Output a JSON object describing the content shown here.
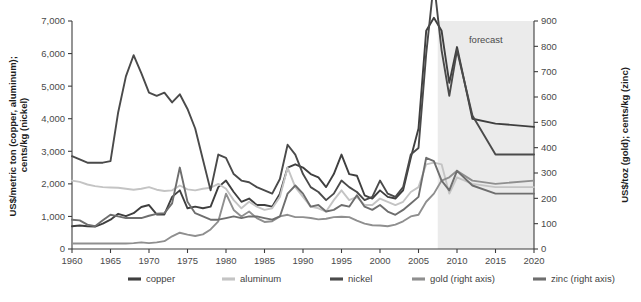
{
  "chart_data": {
    "type": "line",
    "title": "",
    "xlabel": "",
    "ylabel": "US$/metric ton (copper, aluminum); cents/kg (nickel)",
    "y2label": "US$/toz (gold); cents/kg (zinc)",
    "xlim": [
      1960,
      2020
    ],
    "ylim": [
      0,
      7000
    ],
    "y2lim": [
      0,
      900
    ],
    "grid": false,
    "legend_position": "bottom",
    "x_ticks": [
      1960,
      1965,
      1970,
      1975,
      1980,
      1985,
      1990,
      1995,
      2000,
      2005,
      2010,
      2015,
      2020
    ],
    "y_ticks": [
      0,
      1000,
      2000,
      3000,
      4000,
      5000,
      6000,
      7000
    ],
    "y_tick_labels": [
      "0",
      "1,000",
      "2,000",
      "3,000",
      "4,000",
      "5,000",
      "6,000",
      "7,000"
    ],
    "y2_ticks": [
      0,
      100,
      200,
      300,
      400,
      500,
      600,
      700,
      800,
      900
    ],
    "y2_tick_labels": [
      "0",
      "100",
      "200",
      "300",
      "400",
      "500",
      "600",
      "700",
      "800",
      "900"
    ],
    "annotations": [
      {
        "text": "forecast",
        "x_start": 2007.5,
        "x_end": 2020,
        "type": "shaded-band"
      }
    ],
    "x": [
      1960,
      1961,
      1962,
      1963,
      1964,
      1965,
      1966,
      1967,
      1968,
      1969,
      1970,
      1971,
      1972,
      1973,
      1974,
      1975,
      1976,
      1977,
      1978,
      1979,
      1980,
      1981,
      1982,
      1983,
      1984,
      1985,
      1986,
      1987,
      1988,
      1989,
      1990,
      1991,
      1992,
      1993,
      1994,
      1995,
      1996,
      1997,
      1998,
      1999,
      2000,
      2001,
      2002,
      2003,
      2004,
      2005,
      2006,
      2007,
      2008,
      2009,
      2010,
      2012,
      2015,
      2020
    ],
    "series": [
      {
        "name": "copper",
        "axis": "left",
        "unit": "US$/metric ton",
        "color": "#3f3f3f",
        "values": [
          700,
          720,
          700,
          690,
          780,
          900,
          1080,
          1010,
          1100,
          1290,
          1350,
          1060,
          1060,
          1600,
          1800,
          1250,
          1300,
          1250,
          1300,
          1900,
          2100,
          1750,
          1450,
          1550,
          1350,
          1350,
          1300,
          1700,
          2500,
          2600,
          2500,
          2300,
          2200,
          1900,
          2300,
          2900,
          2300,
          2250,
          1650,
          1550,
          1800,
          1600,
          1550,
          1800,
          2800,
          3700,
          6700,
          7100,
          6700,
          5100,
          6200,
          4000,
          3850,
          3750
        ],
        "label_at_end": 2900
      },
      {
        "name": "aluminum",
        "axis": "left",
        "unit": "US$/metric ton",
        "color": "#c4c4c4",
        "values": [
          2100,
          2060,
          1980,
          1930,
          1900,
          1890,
          1880,
          1850,
          1820,
          1850,
          1900,
          1820,
          1780,
          1800,
          1950,
          1830,
          1800,
          1850,
          1880,
          2000,
          1850,
          1500,
          1250,
          1450,
          1300,
          1200,
          1250,
          1600,
          2500,
          1900,
          1600,
          1300,
          1250,
          1150,
          1500,
          1800,
          1500,
          1600,
          1350,
          1350,
          1550,
          1450,
          1350,
          1450,
          1750,
          1900,
          2600,
          2650,
          2600,
          1700,
          2200,
          2000,
          1900,
          1900
        ]
      },
      {
        "name": "nickel",
        "axis": "left",
        "unit": "cents/kg",
        "color": "#4a4a4a",
        "values": [
          2850,
          2750,
          2650,
          2650,
          2650,
          2700,
          4200,
          5300,
          5950,
          5400,
          4800,
          4700,
          4800,
          4500,
          4750,
          4300,
          3700,
          2750,
          1800,
          2900,
          2800,
          2300,
          2100,
          2050,
          1900,
          1800,
          1700,
          2150,
          3200,
          2900,
          2300,
          1900,
          1750,
          1500,
          1700,
          2100,
          1900,
          1750,
          1500,
          1600,
          2100,
          1700,
          1600,
          1900,
          2900,
          3100,
          6000,
          8200,
          6100,
          4700,
          6100,
          4100,
          2900,
          2900
        ]
      },
      {
        "name": "gold",
        "axis": "right",
        "unit": "US$/toz",
        "color": "#8f8f8f",
        "values": [
          170,
          170,
          170,
          170,
          170,
          170,
          170,
          170,
          180,
          205,
          180,
          205,
          240,
          390,
          500,
          440,
          400,
          450,
          600,
          850,
          1700,
          1200,
          1000,
          1150,
          950,
          830,
          850,
          1000,
          1050,
          980,
          980,
          950,
          910,
          930,
          980,
          990,
          980,
          870,
          780,
          730,
          720,
          700,
          750,
          850,
          1000,
          1050,
          1450,
          1700,
          2100,
          2200,
          2400,
          2100,
          2000,
          2100
        ],
        "note": "plotted on right axis scale 0-900"
      },
      {
        "name": "zinc",
        "axis": "right",
        "unit": "cents/kg",
        "color": "#6e6e6e",
        "values": [
          900,
          880,
          750,
          700,
          880,
          1050,
          1000,
          950,
          950,
          950,
          1020,
          1080,
          1100,
          1400,
          2500,
          1450,
          1100,
          1000,
          900,
          900,
          950,
          1000,
          950,
          1000,
          1000,
          950,
          900,
          1000,
          1700,
          1950,
          1700,
          1300,
          1350,
          1150,
          1200,
          1350,
          1300,
          1650,
          1300,
          1200,
          1350,
          1150,
          1050,
          1200,
          1400,
          1600,
          2800,
          2700,
          2100,
          1800,
          2400,
          1950,
          1700,
          1700
        ],
        "note": "plotted on right axis scale 0-900"
      }
    ]
  },
  "axes": {
    "left_title": "US$/metric ton (copper, aluminum); cents/kg (nickel)",
    "right_title": "US$/toz (gold); cents/kg (zinc)",
    "y_labels": [
      "7,000",
      "6,000",
      "5,000",
      "4,000",
      "3,000",
      "2,000",
      "1,000",
      "0"
    ],
    "y2_labels": [
      "900",
      "800",
      "700",
      "600",
      "500",
      "400",
      "300",
      "200",
      "100",
      "0"
    ],
    "x_labels": [
      "1960",
      "1965",
      "1970",
      "1975",
      "1980",
      "1985",
      "1990",
      "1995",
      "2000",
      "2005",
      "2010",
      "2015",
      "2020"
    ]
  },
  "forecast": {
    "label": "forecast",
    "band_color": "#ebebeb"
  },
  "legend": {
    "items": [
      {
        "label": "copper",
        "color": "#3f3f3f"
      },
      {
        "label": "aluminum",
        "color": "#c4c4c4"
      },
      {
        "label": "nickel",
        "color": "#4a4a4a"
      },
      {
        "label": "gold (right axis)",
        "color": "#8f8f8f"
      },
      {
        "label": "zinc (right axis)",
        "color": "#6e6e6e"
      }
    ]
  }
}
